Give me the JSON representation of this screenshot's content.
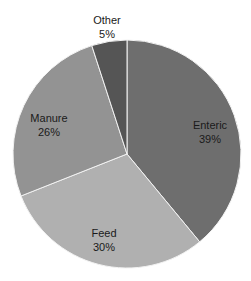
{
  "chart_data": {
    "type": "pie",
    "title": "",
    "start_angle_deg": 0,
    "direction": "clockwise",
    "slices": [
      {
        "label": "Enteric",
        "value": 39,
        "display": "39%",
        "color": "#6e6e6e"
      },
      {
        "label": "Feed",
        "value": 30,
        "display": "30%",
        "color": "#b0b0b0"
      },
      {
        "label": "Manure",
        "value": 26,
        "display": "26%",
        "color": "#939393"
      },
      {
        "label": "Other",
        "value": 5,
        "display": "5%",
        "color": "#555555"
      }
    ],
    "categories": [
      "Enteric",
      "Feed",
      "Manure",
      "Other"
    ],
    "values": [
      39,
      30,
      26,
      5
    ],
    "legend": "none",
    "label_style": "category and percent inside slice"
  },
  "labels": [
    {
      "name": "Enteric",
      "pct": "39%"
    },
    {
      "name": "Feed",
      "pct": "30%"
    },
    {
      "name": "Manure",
      "pct": "26%"
    },
    {
      "name": "Other",
      "pct": "5%"
    }
  ]
}
